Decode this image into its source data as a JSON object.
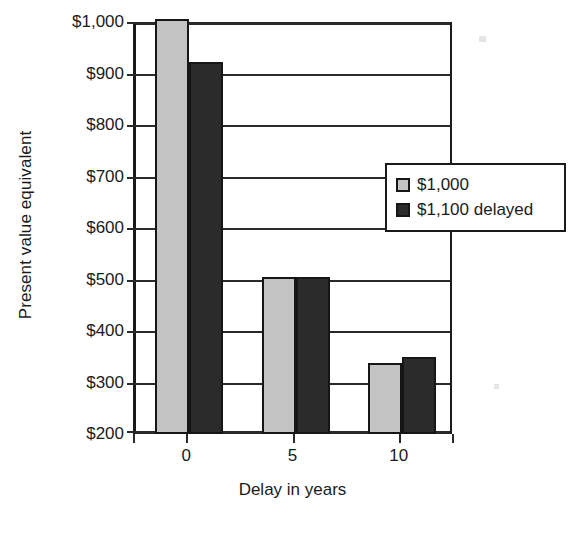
{
  "chart_data": {
    "type": "bar",
    "title": "",
    "xlabel": "Delay in years",
    "ylabel": "Present value equivalent",
    "categories": [
      "0",
      "5",
      "10"
    ],
    "x": [
      0,
      5,
      10
    ],
    "series": [
      {
        "name": "$1,000",
        "values": [
          1000,
          500,
          333
        ],
        "color": "#c3c3c3"
      },
      {
        "name": "$1,100 delayed",
        "values": [
          917,
          500,
          344
        ],
        "color": "#2b2b2b"
      }
    ],
    "ylim": [
      200,
      1000
    ],
    "yticks": [
      200,
      300,
      400,
      500,
      600,
      700,
      800,
      900,
      1000
    ],
    "ytick_labels": [
      "$200",
      "$300",
      "$400",
      "$500",
      "$600",
      "$700",
      "$800",
      "$900",
      "$1,000"
    ],
    "xtick_labels": [
      "0",
      "5",
      "10"
    ],
    "grid": true,
    "grid_axis": "y",
    "legend_position": "right-inside",
    "legend_entries": [
      "$1,000",
      "$1,100 delayed"
    ]
  },
  "axes": {
    "y_title": "Present value equivalent",
    "x_title": "Delay in years"
  },
  "legend": {
    "items": [
      {
        "label": "$1,000",
        "swatch": "light-gray-swatch"
      },
      {
        "label": "$1,100 delayed",
        "swatch": "dark-gray-swatch"
      }
    ]
  }
}
